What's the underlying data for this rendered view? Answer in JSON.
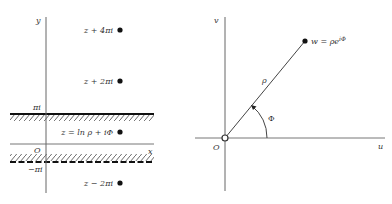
{
  "left_panel": {
    "axis_y_label": "y",
    "axis_x_label": "x",
    "origin_label": "O",
    "upper_bound_label": "πi",
    "lower_bound_label": "−πi",
    "points": [
      {
        "label": "z + 4πi",
        "x": 120,
        "y": 30
      },
      {
        "label": "z + 2πi",
        "x": 120,
        "y": 81
      },
      {
        "label": "z = ln ρ + iΦ",
        "x": 120,
        "y": 132
      },
      {
        "label": "z − 2πi",
        "x": 120,
        "y": 183
      }
    ]
  },
  "right_panel": {
    "axis_v_label": "v",
    "axis_u_label": "u",
    "origin_label": "O",
    "point_label": "w = ρe",
    "point_label_exp": "iΦ",
    "radius_label": "ρ",
    "angle_label": "Φ"
  }
}
